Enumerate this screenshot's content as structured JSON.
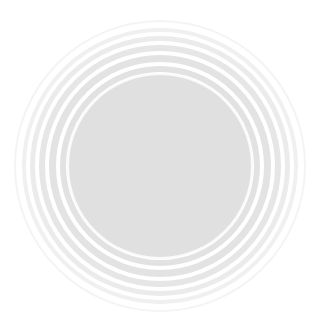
{
  "graphic": {
    "description": "Concentric circles: solid light-gray center disk surrounded by alternating faint gray rings",
    "center": {
      "x": 160,
      "y": 166
    },
    "background_color": "#ffffff",
    "rings": [
      {
        "radius": 146,
        "color": "#f4f4f4",
        "width": 2
      },
      {
        "radius": 141,
        "color": "#ffffff",
        "width": 3
      },
      {
        "radius": 138,
        "color": "#f0f0f0",
        "width": 4
      },
      {
        "radius": 133,
        "color": "#ffffff",
        "width": 3
      },
      {
        "radius": 130,
        "color": "#ebebeb",
        "width": 5
      },
      {
        "radius": 124,
        "color": "#ffffff",
        "width": 3
      },
      {
        "radius": 121,
        "color": "#e6e6e6",
        "width": 6
      },
      {
        "radius": 114,
        "color": "#ffffff",
        "width": 3
      },
      {
        "radius": 111,
        "color": "#e3e3e3",
        "width": 7
      },
      {
        "radius": 103,
        "color": "#ffffff",
        "width": 3
      },
      {
        "radius": 100,
        "color": "#e2e2e2",
        "width": 6
      },
      {
        "radius": 93,
        "color": "#fafafa",
        "width": 2
      }
    ],
    "inner_disk": {
      "radius": 91,
      "color": "#e0e0e0"
    }
  }
}
